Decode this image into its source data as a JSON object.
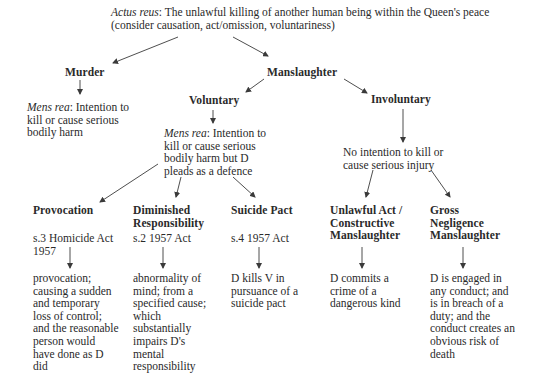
{
  "root": {
    "label_italic": "Actus reus",
    "line1_rest": ": The unlawful killing of another human being within the Queen's peace",
    "line2": "(consider causation, act/omission, voluntariness)"
  },
  "murder": {
    "title": "Murder",
    "mens_rea_label": "Mens rea",
    "mens_rea_lines": [
      ": Intention to",
      "kill or cause serious",
      "bodily harm"
    ]
  },
  "manslaughter": {
    "title": "Manslaughter",
    "voluntary": {
      "title": "Voluntary",
      "mens_rea_label": "Mens rea",
      "mens_rea_lines": [
        ": Intention to",
        "kill or cause serious",
        "bodily harm but D",
        "pleads as a defence"
      ],
      "defences": [
        {
          "title_lines": [
            "Provocation"
          ],
          "statute_lines": [
            "s.3 Homicide Act",
            "1957"
          ],
          "description_lines": [
            "provocation;",
            "causing a sudden",
            "and temporary",
            "loss of control;",
            "and the reasonable",
            "person would",
            "have done as D",
            "did"
          ]
        },
        {
          "title_lines": [
            "Diminished",
            "Responsibility"
          ],
          "statute_lines": [
            "s.2 1957 Act"
          ],
          "description_lines": [
            "abnormality of",
            "mind; from a",
            "specified cause;",
            "which",
            "substantially",
            "impairs D's",
            "mental",
            "responsibility"
          ]
        },
        {
          "title_lines": [
            "Suicide Pact"
          ],
          "statute_lines": [
            "s.4 1957 Act"
          ],
          "description_lines": [
            "D kills V in",
            "pursuance of a",
            "suicide pact"
          ]
        }
      ]
    },
    "involuntary": {
      "title": "Involuntary",
      "condition_lines": [
        "No intention to kill or",
        "cause serious injury"
      ],
      "types": [
        {
          "title_lines": [
            "Unlawful Act /",
            "Constructive",
            "Manslaughter"
          ],
          "description_lines": [
            "D commits a",
            "crime of a",
            "dangerous kind"
          ]
        },
        {
          "title_lines": [
            "Gross",
            "Negligence",
            "Manslaughter"
          ],
          "description_lines": [
            "D is engaged in",
            "any conduct; and",
            "is in breach of a",
            "duty; and the",
            "conduct creates an",
            "obvious risk of",
            "death"
          ]
        }
      ]
    }
  },
  "colors": {
    "text": "#2a2a2a",
    "line": "#3a3a3a",
    "background": "#ffffff"
  }
}
